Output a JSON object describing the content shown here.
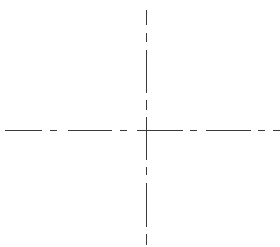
{
  "diagram": {
    "type": "centerline-crosshair",
    "background": "#ffffff",
    "line_color": "#3a3a3a",
    "center": {
      "x": 146,
      "y": 130
    },
    "horizontal_segments": [
      [
        5,
        42
      ],
      [
        50,
        57
      ],
      [
        68,
        112
      ],
      [
        120,
        127
      ],
      [
        137,
        183
      ],
      [
        190,
        197
      ],
      [
        206,
        251
      ],
      [
        258,
        265
      ],
      [
        273,
        280
      ]
    ],
    "vertical_segments": [
      [
        10,
        25
      ],
      [
        33,
        42
      ],
      [
        50,
        93
      ],
      [
        100,
        110
      ],
      [
        117,
        160
      ],
      [
        167,
        175
      ],
      [
        183,
        227
      ],
      [
        234,
        245
      ]
    ]
  }
}
